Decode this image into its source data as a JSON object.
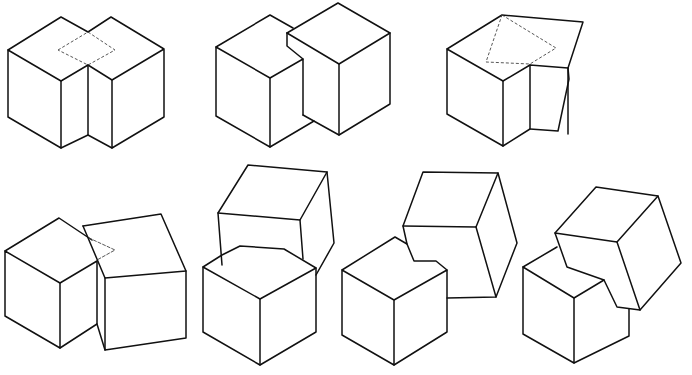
{
  "diagram": {
    "title": "",
    "colors": {
      "background": "#ffffff",
      "line": "#111111",
      "hidden_line": "#444444"
    },
    "figures": [
      {
        "id": "fig-1",
        "row": 1,
        "col": 1,
        "arrangement": "two-cubes-side-by-side-interpenetrating",
        "has_hidden_lines": true
      },
      {
        "id": "fig-2",
        "row": 1,
        "col": 2,
        "arrangement": "two-cubes-offset-overlapping",
        "has_hidden_lines": false
      },
      {
        "id": "fig-3",
        "row": 1,
        "col": 3,
        "arrangement": "cube-with-rotated-cube-interpenetrating",
        "has_hidden_lines": true
      },
      {
        "id": "fig-4",
        "row": 2,
        "col": 1,
        "arrangement": "cube-and-tilted-cube-overlapping",
        "has_hidden_lines": true
      },
      {
        "id": "fig-5",
        "row": 2,
        "col": 2,
        "arrangement": "tilted-cube-behind-front-cube",
        "has_hidden_lines": false
      },
      {
        "id": "fig-6",
        "row": 2,
        "col": 3,
        "arrangement": "rotated-cube-behind-front-cube",
        "has_hidden_lines": false
      },
      {
        "id": "fig-7",
        "row": 2,
        "col": 4,
        "arrangement": "tilted-cube-in-front-of-lower-cube",
        "has_hidden_lines": false
      }
    ]
  }
}
